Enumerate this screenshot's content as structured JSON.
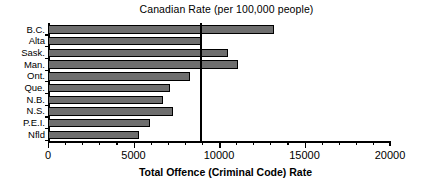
{
  "chart_data": {
    "type": "bar",
    "orientation": "horizontal",
    "title": "Canadian Rate (per 100,000 people)",
    "xlabel": "Total Offence (Criminal Code) Rate",
    "ylabel": "",
    "categories": [
      "B.C.",
      "Alta",
      "Sask.",
      "Man.",
      "Ont.",
      "Que.",
      "N.B.",
      "N.S.",
      "P.E.I.",
      "Nfld"
    ],
    "values": [
      13200,
      8950,
      10500,
      11100,
      8300,
      7150,
      6700,
      7300,
      5950,
      5350
    ],
    "xlim": [
      0,
      20000
    ],
    "xticks": [
      0,
      5000,
      10000,
      15000,
      20000
    ],
    "xtick_labels": [
      "0",
      "5000",
      "10000",
      "15000",
      "20000"
    ],
    "minor_tick_interval": 1000,
    "grid": false,
    "legend": "none",
    "bar_color": "#6e6e6e",
    "bar_edge_color": "#000000",
    "annotations": [
      {
        "name": "canadian-rate-reference-line",
        "label": "Canadian Rate (per 100,000 people)",
        "value": 8900,
        "orientation": "vertical",
        "color": "#000000"
      }
    ]
  }
}
